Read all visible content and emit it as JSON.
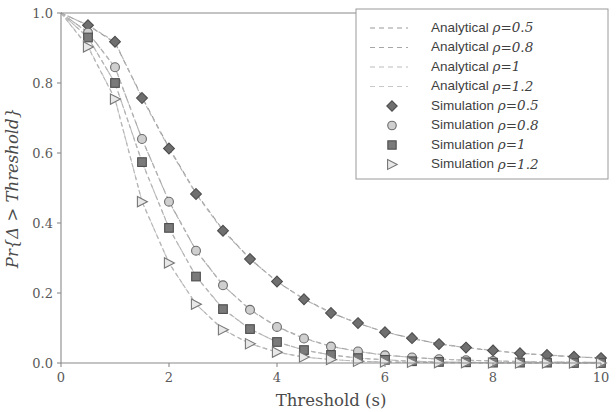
{
  "chart_data": {
    "type": "line",
    "title": "",
    "xlabel": "Threshold (s)",
    "ylabel": "Pr{Δ > Threshold}",
    "xlim": [
      0,
      10
    ],
    "ylim": [
      0.0,
      1.0
    ],
    "xticks": [
      "0",
      "2",
      "4",
      "6",
      "8",
      "10"
    ],
    "xtick_values": [
      0,
      2,
      4,
      6,
      8,
      10
    ],
    "yticks": [
      "0.0",
      "0.2",
      "0.4",
      "0.6",
      "0.8",
      "1.0"
    ],
    "ytick_values": [
      0.0,
      0.2,
      0.4,
      0.6,
      0.8,
      1.0
    ],
    "grid": false,
    "legend_position": "upper-right",
    "x": [
      0,
      0.5,
      1,
      1.5,
      2,
      2.5,
      3,
      3.5,
      4,
      4.5,
      5,
      5.5,
      6,
      6.5,
      7,
      7.5,
      8,
      8.5,
      9,
      9.5,
      10
    ],
    "series": [
      {
        "name": "Analytical ρ=0.5",
        "kind": "analytical",
        "rho": "0.5",
        "style": "dashed",
        "color": "#9a9a9a",
        "values": [
          1.0,
          0.965,
          0.915,
          0.76,
          0.615,
          0.485,
          0.38,
          0.298,
          0.232,
          0.183,
          0.144,
          0.113,
          0.089,
          0.07,
          0.055,
          0.044,
          0.035,
          0.028,
          0.022,
          0.018,
          0.014
        ]
      },
      {
        "name": "Analytical ρ=0.8",
        "kind": "analytical",
        "rho": "0.8",
        "style": "dashed",
        "color": "#a6a6a6",
        "values": [
          1.0,
          0.945,
          0.845,
          0.64,
          0.462,
          0.322,
          0.222,
          0.153,
          0.104,
          0.071,
          0.048,
          0.033,
          0.023,
          0.016,
          0.011,
          0.008,
          0.006,
          0.004,
          0.003,
          0.002,
          0.002
        ]
      },
      {
        "name": "Analytical ρ=1",
        "kind": "analytical",
        "rho": "1",
        "style": "dashed",
        "color": "#bcbcbc",
        "values": [
          1.0,
          0.93,
          0.8,
          0.575,
          0.385,
          0.248,
          0.155,
          0.097,
          0.06,
          0.037,
          0.023,
          0.014,
          0.009,
          0.005,
          0.003,
          0.002,
          0.001,
          0.001,
          0.001,
          0.0,
          0.0
        ]
      },
      {
        "name": "Analytical ρ=1.2",
        "kind": "analytical",
        "rho": "1.2",
        "style": "dashed",
        "color": "#c8c8c8",
        "values": [
          1.0,
          0.905,
          0.755,
          0.462,
          0.285,
          0.168,
          0.096,
          0.055,
          0.031,
          0.017,
          0.01,
          0.005,
          0.003,
          0.002,
          0.001,
          0.001,
          0.0,
          0.0,
          0.0,
          0.0,
          0.0
        ]
      },
      {
        "name": "Simulation ρ=0.5",
        "kind": "simulation",
        "rho": "0.5",
        "marker": "diamond",
        "color": "#6f6f6f",
        "values": [
          1.0,
          0.965,
          0.918,
          0.757,
          0.613,
          0.483,
          0.378,
          0.297,
          0.233,
          0.182,
          0.143,
          0.114,
          0.088,
          0.071,
          0.054,
          0.044,
          0.036,
          0.028,
          0.023,
          0.018,
          0.014
        ]
      },
      {
        "name": "Simulation ρ=0.8",
        "kind": "simulation",
        "rho": "0.8",
        "marker": "circle",
        "color": "#8a8a8a",
        "values": [
          1.0,
          0.944,
          0.845,
          0.64,
          0.461,
          0.321,
          0.222,
          0.152,
          0.103,
          0.07,
          0.047,
          0.033,
          0.022,
          0.016,
          0.011,
          0.008,
          0.006,
          0.004,
          0.003,
          0.002,
          0.002
        ]
      },
      {
        "name": "Simulation ρ=1",
        "kind": "simulation",
        "rho": "1",
        "marker": "square",
        "color": "#7a7a7a",
        "values": [
          1.0,
          0.93,
          0.8,
          0.574,
          0.386,
          0.247,
          0.154,
          0.097,
          0.06,
          0.037,
          0.023,
          0.014,
          0.009,
          0.005,
          0.003,
          0.002,
          0.001,
          0.001,
          0.001,
          0.0,
          0.0
        ]
      },
      {
        "name": "Simulation ρ=1.2",
        "kind": "simulation",
        "rho": "1.2",
        "marker": "triangle",
        "color": "#9e9e9e",
        "values": [
          1.0,
          0.903,
          0.754,
          0.461,
          0.286,
          0.168,
          0.095,
          0.055,
          0.031,
          0.017,
          0.01,
          0.005,
          0.003,
          0.002,
          0.001,
          0.001,
          0.0,
          0.0,
          0.0,
          0.0,
          0.0
        ]
      }
    ]
  },
  "legend": {
    "items": [
      {
        "label": "Analytical ",
        "rho": "ρ=0.5",
        "type": "line",
        "color": "#9a9a9a"
      },
      {
        "label": "Analytical ",
        "rho": "ρ=0.8",
        "type": "line",
        "color": "#a6a6a6"
      },
      {
        "label": "Analytical ",
        "rho": "ρ=1",
        "type": "line",
        "color": "#bcbcbc"
      },
      {
        "label": "Analytical ",
        "rho": "ρ=1.2",
        "type": "line",
        "color": "#c8c8c8"
      },
      {
        "label": "Simulation ",
        "rho": "ρ=0.5",
        "type": "diamond",
        "color": "#6f6f6f"
      },
      {
        "label": "Simulation ",
        "rho": "ρ=0.8",
        "type": "circle",
        "color": "#8a8a8a"
      },
      {
        "label": "Simulation ",
        "rho": "ρ=1",
        "type": "square",
        "color": "#7a7a7a"
      },
      {
        "label": "Simulation ",
        "rho": "ρ=1.2",
        "type": "triangle",
        "color": "#9e9e9e"
      }
    ]
  }
}
